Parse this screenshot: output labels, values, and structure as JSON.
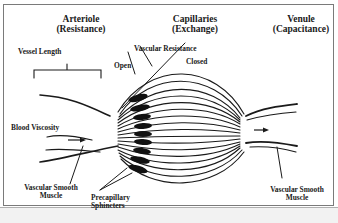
{
  "diagram": {
    "sections": [
      {
        "name": "Arteriole",
        "role": "(Resistance)"
      },
      {
        "name": "Capillaries",
        "role": "(Exchange)"
      },
      {
        "name": "Venule",
        "role": "(Capacitance)"
      }
    ],
    "labels": {
      "vessel_length": "Vessel Length",
      "vascular_resistance": "Vascular Resistance",
      "open": "Open",
      "closed": "Closed",
      "blood_viscosity": "Blood Viscosity",
      "vsm_left_line1": "Vascular Smooth",
      "vsm_left_line2": "Muscle",
      "precap_line1": "Precapillary",
      "precap_line2": "Sphincters",
      "vsm_right_line1": "Vascular Smooth",
      "vsm_right_line2": "Muscle"
    },
    "colors": {
      "ink": "#1a1a1a",
      "frame": "#7a7a7a"
    }
  }
}
